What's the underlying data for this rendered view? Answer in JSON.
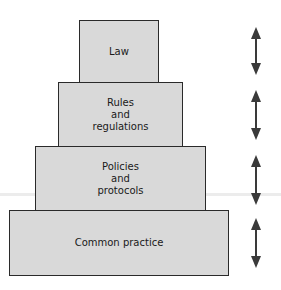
{
  "diagram": {
    "type": "pyramid",
    "tiers": [
      {
        "label": "Law"
      },
      {
        "label": "Rules\nand\nregulations"
      },
      {
        "label": "Policies\nand\nprotocols"
      },
      {
        "label": "Common practice"
      }
    ],
    "arrows": [
      "double-arrow-vertical",
      "double-arrow-vertical",
      "double-arrow-vertical",
      "double-arrow-vertical"
    ],
    "colors": {
      "fill": "#d9d9d9",
      "border": "#2a2a2a",
      "arrow": "#3a3a3a"
    }
  }
}
